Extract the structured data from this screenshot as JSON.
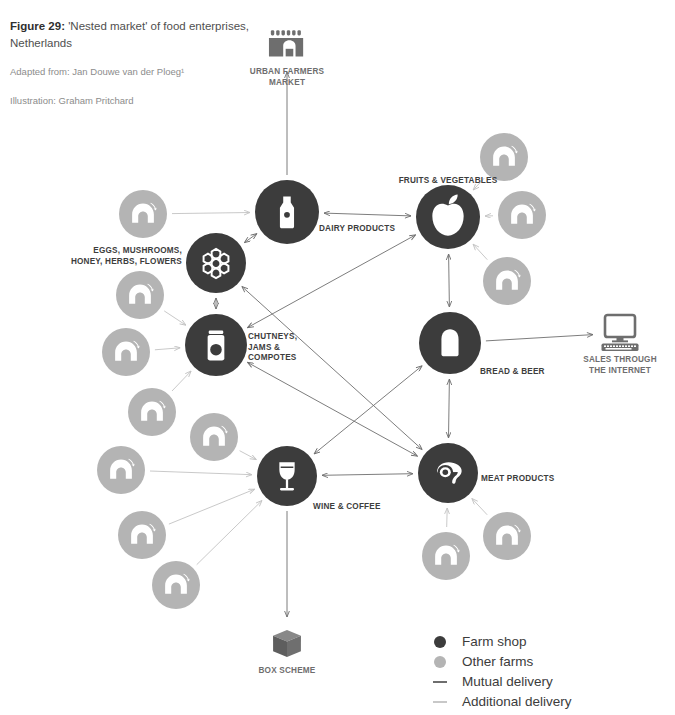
{
  "figure": {
    "title_prefix": "Figure 29:",
    "title_text": " 'Nested market' of food enterprises, Netherlands",
    "adapted_from": "Adapted from: Jan Douwe van der Ploeg¹",
    "illustration": "Illustration: Graham Pritchard"
  },
  "colors": {
    "farm_shop": "#3c3c3c",
    "other_farms": "#b4b4b4",
    "mutual_delivery": "#6e6e6e",
    "additional_delivery": "#c3c3c3",
    "icon_gray": "#6e6e6e",
    "label": "#3d3d3d",
    "background": "#ffffff"
  },
  "legend": {
    "items": [
      {
        "label": "Farm shop",
        "mark": "dot",
        "color": "#3c3c3c"
      },
      {
        "label": "Other farms",
        "mark": "dot",
        "color": "#b4b4b4"
      },
      {
        "label": "Mutual delivery",
        "mark": "line",
        "color": "#6e6e6e"
      },
      {
        "label": "Additional delivery",
        "mark": "line",
        "color": "#c8c8c8"
      }
    ]
  },
  "chart_data": {
    "type": "diagram",
    "title": "'Nested market' of food enterprises, Netherlands",
    "node_types": {
      "farm_shop": "Farm shop (dark circle)",
      "other_farms": "Other farms (light gray circle)",
      "outlet": "External outlet icon"
    },
    "edge_types": {
      "mutual_delivery": "Mutual delivery (dark line, double arrow)",
      "additional_delivery": "Additional delivery (light line, single arrow)"
    },
    "farm_shops": [
      {
        "id": "dairy",
        "label": "DAIRY PRODUCTS",
        "icon": "milk-bottle-icon",
        "x": 287,
        "y": 212,
        "r": 32,
        "label_x": 319,
        "label_y": 224,
        "align": "left"
      },
      {
        "id": "fruitveg",
        "label": "FRUITS & VEGETABLES",
        "icon": "apple-icon",
        "x": 448,
        "y": 217,
        "r": 32,
        "label_x": 448,
        "label_y": 176,
        "align": "center"
      },
      {
        "id": "eggs",
        "label": "EGGS, MUSHROOMS,\nHONEY, HERBS, FLOWERS",
        "icon": "honeycomb-icon",
        "x": 216,
        "y": 263,
        "r": 30,
        "label_x": 182,
        "label_y": 246,
        "align": "right"
      },
      {
        "id": "chutney",
        "label": "CHUTNEYS,\nJAMS &\nCOMPOTES",
        "icon": "jam-jar-icon",
        "x": 216,
        "y": 345,
        "r": 31,
        "label_x": 248,
        "label_y": 332,
        "align": "left"
      },
      {
        "id": "bread",
        "label": "BREAD & BEER",
        "icon": "bread-slice-icon",
        "x": 450,
        "y": 343,
        "r": 31,
        "label_x": 480,
        "label_y": 367,
        "align": "left"
      },
      {
        "id": "wine",
        "label": "WINE & COFFEE",
        "icon": "wine-glass-icon",
        "x": 287,
        "y": 476,
        "r": 30,
        "label_x": 313,
        "label_y": 502,
        "align": "left"
      },
      {
        "id": "meat",
        "label": "MEAT PRODUCTS",
        "icon": "meat-cut-icon",
        "x": 448,
        "y": 473,
        "r": 30,
        "label_x": 481,
        "label_y": 474,
        "align": "left"
      }
    ],
    "other_farms": [
      {
        "id": "f1",
        "x": 143,
        "y": 214,
        "r": 24
      },
      {
        "id": "f2",
        "x": 140,
        "y": 295,
        "r": 24
      },
      {
        "id": "f3",
        "x": 126,
        "y": 352,
        "r": 24
      },
      {
        "id": "f4",
        "x": 152,
        "y": 412,
        "r": 24
      },
      {
        "id": "f5",
        "x": 214,
        "y": 437,
        "r": 24
      },
      {
        "id": "f6",
        "x": 121,
        "y": 470,
        "r": 24
      },
      {
        "id": "f7",
        "x": 142,
        "y": 535,
        "r": 24
      },
      {
        "id": "f8",
        "x": 176,
        "y": 585,
        "r": 24
      },
      {
        "id": "f9",
        "x": 504,
        "y": 157,
        "r": 24
      },
      {
        "id": "f10",
        "x": 522,
        "y": 215,
        "r": 24
      },
      {
        "id": "f11",
        "x": 507,
        "y": 281,
        "r": 24
      },
      {
        "id": "f12",
        "x": 446,
        "y": 556,
        "r": 24
      },
      {
        "id": "f13",
        "x": 507,
        "y": 536,
        "r": 24
      }
    ],
    "outlets": [
      {
        "id": "market",
        "label": "URBAN FARMERS\nMARKET",
        "icon": "market-stall-icon",
        "x": 287,
        "y": 45,
        "label_x": 287,
        "label_y": 66
      },
      {
        "id": "internet",
        "label": "SALES THROUGH\nTHE INTERNET",
        "icon": "computer-icon",
        "x": 620,
        "y": 333,
        "label_x": 620,
        "label_y": 354
      },
      {
        "id": "box",
        "label": "BOX SCHEME",
        "icon": "box-icon",
        "x": 287,
        "y": 644,
        "label_x": 287,
        "label_y": 665
      }
    ],
    "edges": [
      {
        "from": "dairy",
        "to": "market",
        "type": "mutual",
        "arrows": "end"
      },
      {
        "from": "bread",
        "to": "internet",
        "type": "mutual",
        "arrows": "end"
      },
      {
        "from": "wine",
        "to": "box",
        "type": "mutual",
        "arrows": "end"
      },
      {
        "from": "dairy",
        "to": "fruitveg",
        "type": "mutual",
        "arrows": "both"
      },
      {
        "from": "dairy",
        "to": "eggs",
        "type": "mutual",
        "arrows": "both"
      },
      {
        "from": "eggs",
        "to": "chutney",
        "type": "mutual",
        "arrows": "both"
      },
      {
        "from": "fruitveg",
        "to": "bread",
        "type": "mutual",
        "arrows": "both"
      },
      {
        "from": "wine",
        "to": "meat",
        "type": "mutual",
        "arrows": "both"
      },
      {
        "from": "chutney",
        "to": "fruitveg",
        "type": "mutual",
        "arrows": "both"
      },
      {
        "from": "chutney",
        "to": "meat",
        "type": "mutual",
        "arrows": "both"
      },
      {
        "from": "eggs",
        "to": "meat",
        "type": "mutual",
        "arrows": "both"
      },
      {
        "from": "bread",
        "to": "wine",
        "type": "mutual",
        "arrows": "both"
      },
      {
        "from": "bread",
        "to": "meat",
        "type": "mutual",
        "arrows": "both"
      },
      {
        "from": "f1",
        "to": "dairy",
        "type": "additional",
        "arrows": "end"
      },
      {
        "from": "f2",
        "to": "chutney",
        "type": "additional",
        "arrows": "end"
      },
      {
        "from": "f3",
        "to": "chutney",
        "type": "additional",
        "arrows": "end"
      },
      {
        "from": "f4",
        "to": "chutney",
        "type": "additional",
        "arrows": "end"
      },
      {
        "from": "f5",
        "to": "wine",
        "type": "additional",
        "arrows": "end"
      },
      {
        "from": "f6",
        "to": "wine",
        "type": "additional",
        "arrows": "end"
      },
      {
        "from": "f7",
        "to": "wine",
        "type": "additional",
        "arrows": "end"
      },
      {
        "from": "f8",
        "to": "wine",
        "type": "additional",
        "arrows": "end"
      },
      {
        "from": "f9",
        "to": "fruitveg",
        "type": "additional",
        "arrows": "end"
      },
      {
        "from": "f10",
        "to": "fruitveg",
        "type": "additional",
        "arrows": "end"
      },
      {
        "from": "f11",
        "to": "fruitveg",
        "type": "additional",
        "arrows": "end"
      },
      {
        "from": "f12",
        "to": "meat",
        "type": "additional",
        "arrows": "end"
      },
      {
        "from": "f13",
        "to": "meat",
        "type": "additional",
        "arrows": "end"
      }
    ]
  }
}
